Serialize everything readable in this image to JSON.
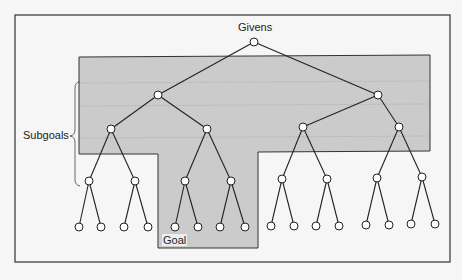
{
  "diagram": {
    "labels": {
      "givens": "Givens",
      "subgoals": "Subgoals",
      "goal": "Goal"
    },
    "colors": {
      "background": "#f6f6f6",
      "frame": "#333333",
      "shaded_region": "#c9c9c9",
      "node_fill": "#ffffff",
      "edge": "#222222"
    },
    "tree": {
      "type": "binary",
      "levels": 5,
      "root": "Givens",
      "leaf_count": 16,
      "goal_leaf_index": 4
    }
  }
}
